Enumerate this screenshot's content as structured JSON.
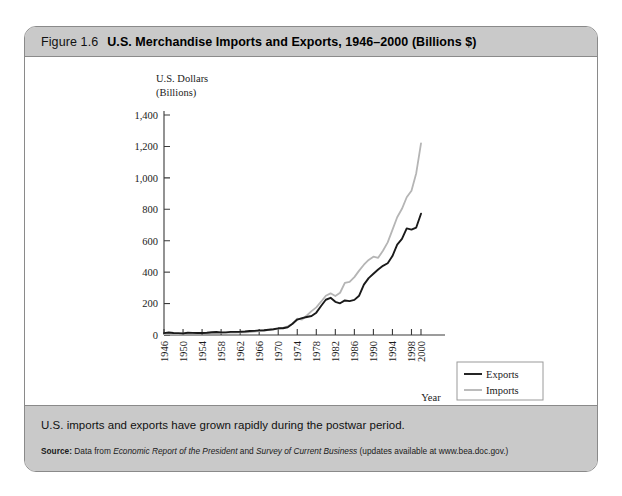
{
  "figure": {
    "number": "Figure 1.6",
    "title": "U.S. Merchandise Imports and Exports, 1946–2000 (Billions $)",
    "caption": "U.S. imports and exports have grown rapidly during the postwar period.",
    "source": {
      "label": "Source:",
      "text_1": " Data from ",
      "italic_1": "Economic Report of the President",
      "text_2": " and ",
      "italic_2": "Survey of Current Business",
      "text_3": " (updates available at www.bea.doc.gov.)"
    }
  },
  "colors": {
    "exports_line": "#1a1a1a",
    "imports_line": "#b5b5b5",
    "band_gray": "#c9c9c9",
    "border_gray": "#8a8a8a",
    "axis": "#3a3a3a"
  },
  "chart_data": {
    "type": "line",
    "ylabel_line1": "U.S. Dollars",
    "ylabel_line2": "(Billions)",
    "xlabel": "Year",
    "ylim": [
      0,
      1400
    ],
    "yticks": [
      0,
      200,
      400,
      600,
      800,
      1000,
      1200,
      1400
    ],
    "ytick_labels": [
      "0",
      "200",
      "400",
      "600",
      "800",
      "1,000",
      "1,200",
      "1,400"
    ],
    "xlim": [
      1946,
      2000
    ],
    "xticks": [
      1946,
      1950,
      1954,
      1958,
      1962,
      1966,
      1970,
      1974,
      1978,
      1982,
      1986,
      1990,
      1994,
      1998,
      2000
    ],
    "xtick_labels": [
      "1946",
      "1950",
      "1954",
      "1958",
      "1962",
      "1966",
      "1970",
      "1974",
      "1978",
      "1982",
      "1986",
      "1990",
      "1994",
      "1998",
      "2000"
    ],
    "grid": false,
    "legend_position": "bottom-right",
    "x": [
      1946,
      1947,
      1948,
      1949,
      1950,
      1951,
      1952,
      1953,
      1954,
      1955,
      1956,
      1957,
      1958,
      1959,
      1960,
      1961,
      1962,
      1963,
      1964,
      1965,
      1966,
      1967,
      1968,
      1969,
      1970,
      1971,
      1972,
      1973,
      1974,
      1975,
      1976,
      1977,
      1978,
      1979,
      1980,
      1981,
      1982,
      1983,
      1984,
      1985,
      1986,
      1987,
      1988,
      1989,
      1990,
      1991,
      1992,
      1993,
      1994,
      1995,
      1996,
      1997,
      1998,
      1999,
      2000
    ],
    "series": [
      {
        "name": "Exports",
        "color": "#1a1a1a",
        "values": [
          11.8,
          16.0,
          13.2,
          12.1,
          10.2,
          14.2,
          13.3,
          12.3,
          12.8,
          14.3,
          17.3,
          19.5,
          16.4,
          16.4,
          19.6,
          20.1,
          20.8,
          22.3,
          25.5,
          26.5,
          29.3,
          30.7,
          33.6,
          36.4,
          42.5,
          43.3,
          49.4,
          71.4,
          98.3,
          107.1,
          114.7,
          120.8,
          142.1,
          184.4,
          224.3,
          237.0,
          211.2,
          201.8,
          219.9,
          215.9,
          223.3,
          250.2,
          320.2,
          362.1,
          389.3,
          416.9,
          440.4,
          456.8,
          502.4,
          575.2,
          612.1,
          678.4,
          670.4,
          684.0,
          772.0
        ]
      },
      {
        "name": "Imports",
        "color": "#b5b5b5",
        "values": [
          5.1,
          6.0,
          7.1,
          6.6,
          9.1,
          11.2,
          10.8,
          10.9,
          10.4,
          11.5,
          12.8,
          13.3,
          13.0,
          15.3,
          15.0,
          14.5,
          16.3,
          17.0,
          18.7,
          21.5,
          25.5,
          26.9,
          33.0,
          35.8,
          39.9,
          45.6,
          55.8,
          70.5,
          103.8,
          98.2,
          124.2,
          151.9,
          176.0,
          212.0,
          249.8,
          265.1,
          247.6,
          268.9,
          332.4,
          338.1,
          368.4,
          409.8,
          447.2,
          477.4,
          498.3,
          491.0,
          536.5,
          589.4,
          668.7,
          749.4,
          803.1,
          876.4,
          918.6,
          1030.0,
          1220.0
        ]
      }
    ]
  },
  "legend": {
    "items": [
      {
        "label": "Exports",
        "color": "#1a1a1a"
      },
      {
        "label": "Imports",
        "color": "#b5b5b5"
      }
    ]
  }
}
